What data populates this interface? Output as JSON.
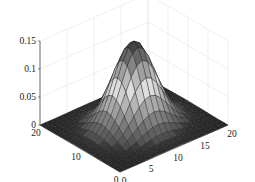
{
  "chart_data": {
    "type": "surface3d",
    "title": "",
    "xlabel": "",
    "ylabel": "",
    "zlabel": "",
    "x_ticks": [
      "0",
      "5",
      "10",
      "15",
      "20"
    ],
    "y_ticks": [
      "0",
      "10",
      "20"
    ],
    "z_ticks": [
      "0",
      "0.05",
      "0.1",
      "0.15"
    ],
    "xlim": [
      0,
      20
    ],
    "ylim": [
      0,
      20
    ],
    "zlim": [
      0,
      0.15
    ],
    "grid": true,
    "colormap": "gray",
    "surface": {
      "function": "gaussian2d",
      "center_x": 10,
      "center_y": 10,
      "sigma": 3.2,
      "peak_z": 0.15,
      "grid_size": 21
    }
  }
}
